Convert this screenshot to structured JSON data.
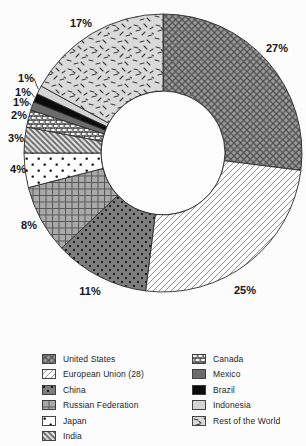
{
  "chart_data": {
    "type": "pie",
    "subtype": "donut",
    "title": "",
    "unit": "%",
    "direction": "clockwise",
    "start_angle_deg": 0,
    "center": {
      "x": 163,
      "y": 153
    },
    "outer_radius": 139,
    "inner_radius": 62,
    "slice_stroke": "#2b2b2b",
    "hole_fill": "#fdfdfd",
    "legend_position": "bottom",
    "slices": [
      {
        "name": "United States",
        "value": 27,
        "label": "27%",
        "pattern": "crosshatch",
        "label_x": 277,
        "label_y": 52,
        "leader": false
      },
      {
        "name": "European Union (28)",
        "value": 25,
        "label": "25%",
        "pattern": "diag-forward",
        "label_x": 245,
        "label_y": 294,
        "leader": false
      },
      {
        "name": "China",
        "value": 11,
        "label": "11%",
        "pattern": "dots-dark",
        "label_x": 90,
        "label_y": 295,
        "leader": false
      },
      {
        "name": "Russian Federation",
        "value": 8,
        "label": "8%",
        "pattern": "grid",
        "label_x": 29,
        "label_y": 229,
        "leader": false
      },
      {
        "name": "Japan",
        "value": 4,
        "label": "4%",
        "pattern": "dots-white",
        "label_x": 18,
        "label_y": 173,
        "leader": false
      },
      {
        "name": "India",
        "value": 3,
        "label": "3%",
        "pattern": "diag-back",
        "label_x": 16,
        "label_y": 142,
        "leader": false
      },
      {
        "name": "Canada",
        "value": 2,
        "label": "2%",
        "pattern": "squares",
        "label_x": 19,
        "label_y": 119,
        "leader": false
      },
      {
        "name": "Mexico",
        "value": 1,
        "label": "1%",
        "pattern": "solid-dark",
        "label_x": 21,
        "label_y": 106,
        "leader": true
      },
      {
        "name": "Brazil",
        "value": 1,
        "label": "1%",
        "pattern": "solid-black",
        "label_x": 23,
        "label_y": 96,
        "leader": true
      },
      {
        "name": "Indonesia",
        "value": 1,
        "label": "1%",
        "pattern": "solid-light",
        "label_x": 26,
        "label_y": 82,
        "leader": true
      },
      {
        "name": "Rest of the World",
        "value": 17,
        "label": "17%",
        "pattern": "speckle",
        "label_x": 81,
        "label_y": 27,
        "leader": false
      }
    ],
    "patterns": {
      "crosshatch": {
        "bg": "#9b9b9b",
        "fg": "#4d4d4d"
      },
      "diag-forward": {
        "bg": "#ffffff",
        "fg": "#8f8f8f"
      },
      "dots-dark": {
        "bg": "#7d7d7d",
        "fg": "#000000"
      },
      "grid": {
        "bg": "#a9a9a9",
        "fg": "#565656"
      },
      "dots-white": {
        "bg": "#ffffff",
        "fg": "#111111"
      },
      "diag-back": {
        "bg": "#e9e9e9",
        "fg": "#6a6a6a"
      },
      "squares": {
        "bg": "#ededed",
        "fg": "#2a2a2a"
      },
      "solid-dark": {
        "bg": "#6b6b6b"
      },
      "solid-black": {
        "bg": "#0c0c0c"
      },
      "solid-light": {
        "bg": "#d3d3d3"
      },
      "speckle": {
        "bg": "#dadada",
        "fg": "#3f3f3f"
      }
    },
    "legend_columns": [
      [
        0,
        1,
        2,
        3,
        4,
        5
      ],
      [
        6,
        7,
        8,
        9,
        10
      ]
    ]
  }
}
